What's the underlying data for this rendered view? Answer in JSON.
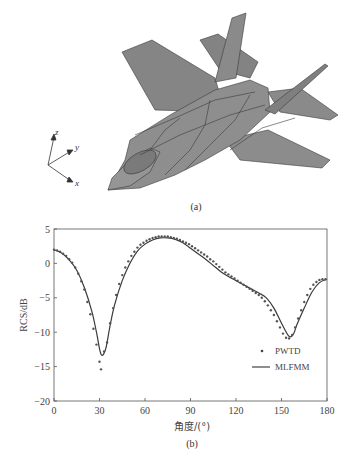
{
  "panel_a": {
    "caption": "(a)",
    "axes_labels": {
      "x": "x",
      "y": "y",
      "z": "z"
    },
    "object": "fighter jet mesh model"
  },
  "panel_b": {
    "caption": "(b)"
  },
  "chart_data": {
    "type": "line",
    "title": "",
    "xlabel": "角度/(°)",
    "ylabel": "RCS/dB",
    "xlim": [
      0,
      180
    ],
    "ylim": [
      -20,
      5
    ],
    "xticks": [
      "0",
      "30",
      "60",
      "90",
      "120",
      "150",
      "180"
    ],
    "yticks": [
      "5",
      "0",
      "−5",
      "−10",
      "−15",
      "−20"
    ],
    "grid": false,
    "legend_position": "lower right",
    "series": [
      {
        "name": "PWTD",
        "style": "markers",
        "x": [
          0,
          2,
          4,
          6,
          8,
          10,
          12,
          14,
          16,
          18,
          20,
          22,
          24,
          26,
          28,
          30,
          31,
          33,
          35,
          37,
          39,
          41,
          43,
          45,
          47,
          49,
          51,
          53,
          55,
          57,
          59,
          61,
          63,
          65,
          67,
          69,
          71,
          73,
          75,
          77,
          79,
          81,
          83,
          85,
          87,
          89,
          91,
          93,
          95,
          97,
          99,
          101,
          103,
          105,
          107,
          109,
          111,
          113,
          115,
          117,
          119,
          121,
          123,
          125,
          127,
          129,
          131,
          133,
          135,
          137,
          139,
          141,
          143,
          145,
          147,
          149,
          151,
          153,
          155,
          157,
          159,
          161,
          163,
          165,
          167,
          169,
          171,
          173,
          175,
          177,
          179
        ],
        "y": [
          2.0,
          1.9,
          1.7,
          1.4,
          1.1,
          0.6,
          0.1,
          -0.6,
          -1.5,
          -2.6,
          -3.8,
          -5.6,
          -7.4,
          -9.5,
          -11.8,
          -14.3,
          -15.4,
          -12.8,
          -11.5,
          -8.7,
          -6.5,
          -4.6,
          -3.0,
          -1.7,
          -0.6,
          0.3,
          1.1,
          1.7,
          2.3,
          2.7,
          3.0,
          3.3,
          3.5,
          3.7,
          3.8,
          3.9,
          3.9,
          3.9,
          3.9,
          3.8,
          3.7,
          3.6,
          3.4,
          3.2,
          3.0,
          2.8,
          2.5,
          2.2,
          1.9,
          1.6,
          1.3,
          1.0,
          0.6,
          0.3,
          -0.1,
          -0.5,
          -0.9,
          -1.3,
          -1.6,
          -1.9,
          -2.2,
          -2.5,
          -2.8,
          -3.1,
          -3.4,
          -3.7,
          -4.0,
          -4.3,
          -4.6,
          -5.0,
          -5.5,
          -6.1,
          -6.8,
          -7.5,
          -8.4,
          -9.3,
          -10.2,
          -10.8,
          -10.9,
          -10.4,
          -9.3,
          -8.0,
          -6.8,
          -5.6,
          -4.6,
          -3.7,
          -3.1,
          -2.7,
          -2.4,
          -2.3,
          -2.3
        ]
      },
      {
        "name": "MLFMM",
        "style": "solid line",
        "x": [
          0,
          5,
          10,
          15,
          20,
          25,
          28,
          31,
          34,
          37,
          40,
          45,
          50,
          55,
          60,
          65,
          70,
          75,
          80,
          85,
          90,
          95,
          100,
          105,
          110,
          115,
          120,
          125,
          130,
          135,
          140,
          145,
          150,
          155,
          158,
          160,
          165,
          170,
          175,
          180
        ],
        "y": [
          2.0,
          1.5,
          0.5,
          -1.0,
          -3.5,
          -7.0,
          -10.0,
          -13.2,
          -12.5,
          -9.0,
          -6.0,
          -2.5,
          0.0,
          1.8,
          2.8,
          3.4,
          3.7,
          3.7,
          3.5,
          3.0,
          2.2,
          1.4,
          0.6,
          -0.3,
          -1.2,
          -1.9,
          -2.5,
          -3.1,
          -3.7,
          -4.3,
          -5.0,
          -6.5,
          -8.7,
          -10.6,
          -10.2,
          -9.0,
          -6.5,
          -4.2,
          -2.8,
          -2.3
        ]
      }
    ]
  }
}
